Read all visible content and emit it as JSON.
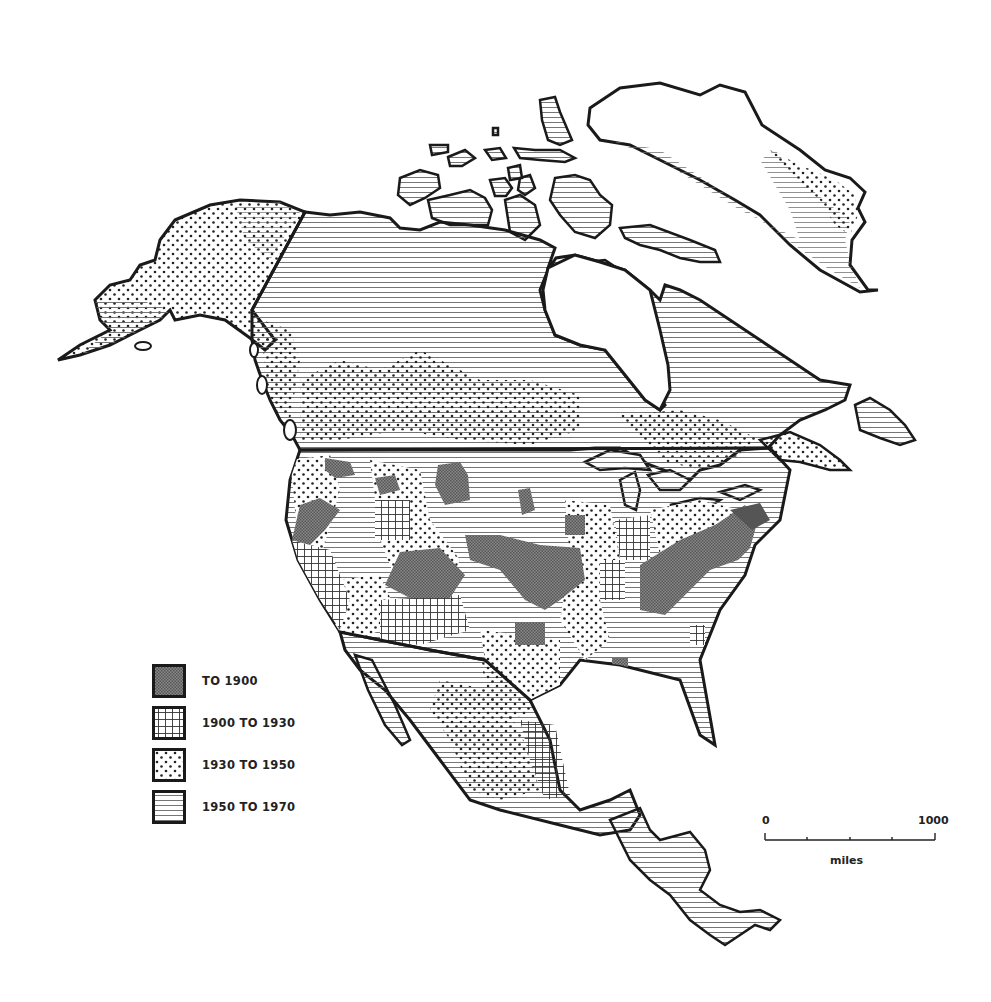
{
  "map": {
    "region": "North America",
    "legend": {
      "items": [
        {
          "label": "TO 1900",
          "pattern": "dark-stipple",
          "color": "#6e6e6e"
        },
        {
          "label": "1900 TO 1930",
          "pattern": "grid-crosshatch",
          "color": "#333333"
        },
        {
          "label": "1930 TO 1950",
          "pattern": "dots",
          "color": "#222222"
        },
        {
          "label": "1950 TO 1970",
          "pattern": "horizontal-lines",
          "color": "#555555"
        }
      ]
    },
    "scale_bar": {
      "start_label": "0",
      "end_label": "1000",
      "unit_label": "miles",
      "ticks": [
        0,
        250,
        500,
        750,
        1000
      ]
    },
    "colors": {
      "outline": "#1a1a1a",
      "background": "#ffffff",
      "stipple": "#6e6e6e"
    }
  }
}
